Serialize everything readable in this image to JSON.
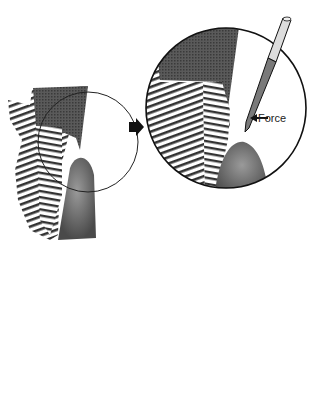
{
  "figure": {
    "labels": {
      "force": "Force"
    },
    "panels": [
      {
        "id": "overview",
        "description": "Tooth section with magnified circle region"
      },
      {
        "id": "step1",
        "description": "Magnified view with instrument applying force"
      },
      {
        "id": "step2",
        "description": "Magnified view with instrument rotated"
      }
    ],
    "arrows": [
      {
        "from": "overview",
        "to": "step1",
        "direction": "right"
      },
      {
        "from": "step1",
        "to": "step2",
        "direction": "down"
      }
    ],
    "colors": {
      "enamel_dark": "#4a4a4a",
      "gingiva": "#6e6e6e",
      "lines": "#111111"
    }
  }
}
